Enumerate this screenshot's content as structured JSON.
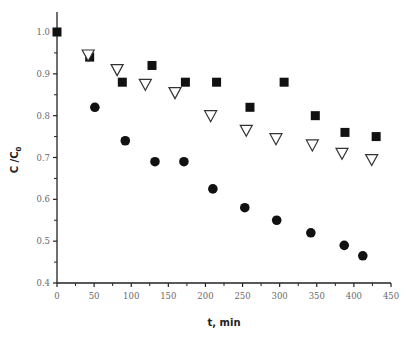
{
  "chart_data": {
    "type": "scatter",
    "title": "",
    "xlabel": "t, min",
    "ylabel": "C /C₀",
    "xlim": [
      0,
      450
    ],
    "ylim": [
      0.4,
      1.05
    ],
    "x_ticks": [
      0,
      50,
      100,
      150,
      200,
      250,
      300,
      350,
      400,
      450
    ],
    "x_tick_labels": [
      "0",
      "50",
      "100",
      "150",
      "200",
      "250",
      "300",
      "350",
      "400",
      "450"
    ],
    "y_ticks": [
      0.4,
      0.5,
      0.6,
      0.7,
      0.8,
      0.9,
      1.0
    ],
    "y_tick_labels": [
      "0.4",
      "0.5",
      "0.6",
      "0.7",
      "0.8",
      "0.9",
      "1.0"
    ],
    "grid": false,
    "legend": null,
    "series": [
      {
        "name": "filled squares",
        "marker": "square-filled",
        "x": [
          0,
          44,
          88,
          128,
          173,
          215,
          260,
          306,
          348,
          388,
          430
        ],
        "y": [
          1.0,
          0.94,
          0.88,
          0.92,
          0.88,
          0.88,
          0.82,
          0.88,
          0.8,
          0.76,
          0.75
        ]
      },
      {
        "name": "open triangles",
        "marker": "triangle-down-open",
        "x": [
          42,
          81,
          119,
          159,
          207,
          255,
          295,
          344,
          384,
          424
        ],
        "y": [
          0.945,
          0.91,
          0.875,
          0.855,
          0.8,
          0.765,
          0.745,
          0.73,
          0.71,
          0.695
        ]
      },
      {
        "name": "filled circles",
        "marker": "circle-filled",
        "x": [
          51,
          92,
          132,
          171,
          210,
          253,
          296,
          342,
          387,
          412
        ],
        "y": [
          0.82,
          0.74,
          0.69,
          0.69,
          0.625,
          0.58,
          0.55,
          0.52,
          0.49,
          0.465
        ]
      }
    ]
  },
  "axes": {
    "x_title": "t, min",
    "y_title_main": "C /C",
    "y_title_sub": "0"
  }
}
